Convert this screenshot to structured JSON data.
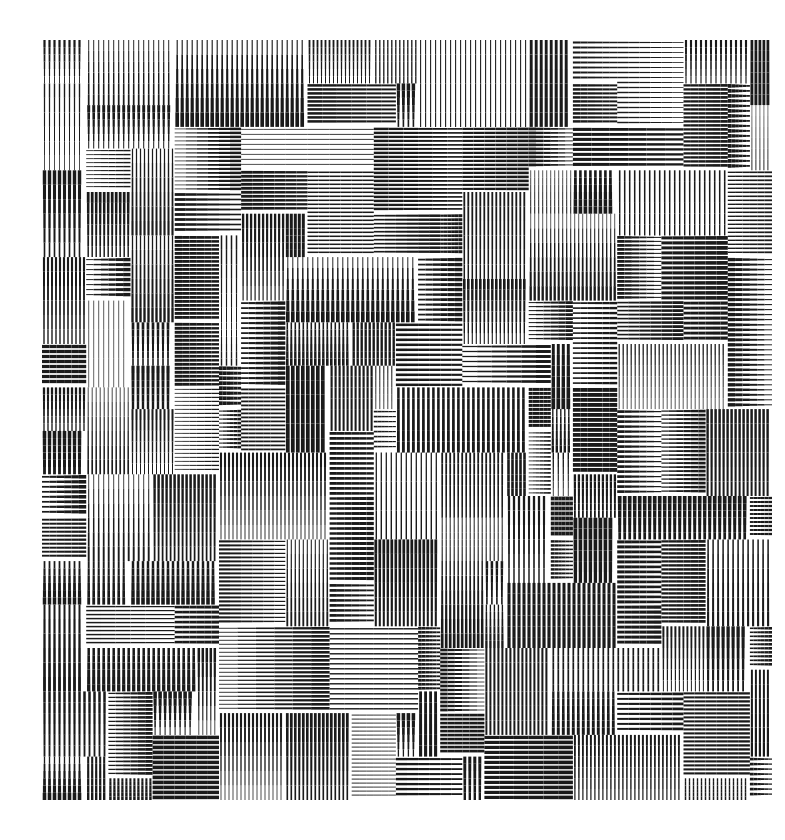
{
  "artwork": {
    "title": "",
    "description": "Abstract op-art composition of rectangles filled with horizontal or vertical hatching lines of graded thickness",
    "colors": {
      "ink": "#1a1a1a",
      "paper": "#ffffff"
    },
    "hatch_orientations": [
      "horizontal",
      "vertical"
    ],
    "seed": 7321
  }
}
